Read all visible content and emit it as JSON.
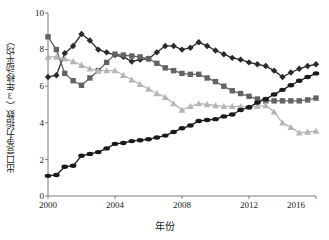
{
  "chart_data": {
    "type": "line",
    "title": "",
    "xlabel": "年份",
    "ylabel": "出口竞争力指数（3年移动平均）",
    "xlim": [
      2000,
      2016
    ],
    "ylim": [
      0,
      10
    ],
    "xticks": [
      2000,
      2004,
      2008,
      2012,
      2016
    ],
    "yticks": [
      0,
      2,
      4,
      6,
      8,
      10
    ],
    "grid": false,
    "legend": "none",
    "x": [
      2000,
      2000.5,
      2001,
      2001.5,
      2002,
      2002.5,
      2003,
      2003.5,
      2004,
      2004.5,
      2005,
      2005.5,
      2006,
      2006.5,
      2007,
      2007.5,
      2008,
      2008.5,
      2009,
      2009.5,
      2010,
      2010.5,
      2011,
      2011.5,
      2012,
      2012.5,
      2013,
      2013.5,
      2014,
      2014.5,
      2015,
      2015.5,
      2016
    ],
    "series": [
      {
        "name": "series-dark-diamond-upper",
        "marker": "diamond",
        "color": "#2b2b2b",
        "values": [
          6.5,
          6.6,
          7.8,
          8.2,
          8.85,
          8.5,
          8.0,
          7.85,
          7.7,
          7.6,
          7.35,
          7.45,
          7.5,
          7.85,
          8.2,
          8.2,
          8.0,
          8.1,
          8.4,
          8.2,
          7.95,
          7.75,
          7.55,
          7.45,
          7.3,
          7.2,
          7.1,
          6.85,
          6.5,
          6.75,
          6.95,
          7.1,
          7.2
        ]
      },
      {
        "name": "series-gray-square",
        "marker": "square",
        "color": "#636363",
        "values": [
          8.7,
          8.0,
          6.7,
          6.3,
          6.05,
          6.45,
          6.85,
          7.3,
          7.75,
          7.7,
          7.65,
          7.6,
          7.5,
          7.25,
          7.0,
          6.85,
          6.7,
          6.65,
          6.65,
          6.45,
          6.25,
          6.0,
          5.75,
          5.6,
          5.45,
          5.3,
          5.2,
          5.2,
          5.2,
          5.2,
          5.2,
          5.25,
          5.35
        ]
      },
      {
        "name": "series-light-triangle",
        "marker": "triangle",
        "color": "#b5b5b5",
        "values": [
          7.6,
          7.6,
          7.5,
          7.35,
          7.15,
          6.95,
          6.85,
          6.85,
          6.85,
          6.6,
          6.35,
          6.1,
          5.85,
          5.6,
          5.4,
          5.05,
          4.7,
          4.9,
          5.05,
          5.0,
          4.95,
          4.9,
          4.9,
          4.9,
          4.85,
          4.9,
          4.95,
          4.6,
          4.0,
          3.75,
          3.45,
          3.5,
          3.55
        ]
      },
      {
        "name": "series-dark-dot-rising",
        "marker": "dot",
        "color": "#1a1a1a",
        "values": [
          1.1,
          1.15,
          1.6,
          1.65,
          2.2,
          2.3,
          2.4,
          2.6,
          2.85,
          2.9,
          3.0,
          3.05,
          3.1,
          3.2,
          3.3,
          3.5,
          3.7,
          3.85,
          4.1,
          4.15,
          4.2,
          4.35,
          4.45,
          4.7,
          4.85,
          5.1,
          5.3,
          5.55,
          5.8,
          6.05,
          6.3,
          6.5,
          6.7
        ]
      }
    ]
  },
  "ytick_labels": [
    "0",
    "2",
    "4",
    "6",
    "8",
    "10"
  ],
  "xtick_labels": [
    "2000",
    "2004",
    "2008",
    "2012",
    "2016"
  ]
}
